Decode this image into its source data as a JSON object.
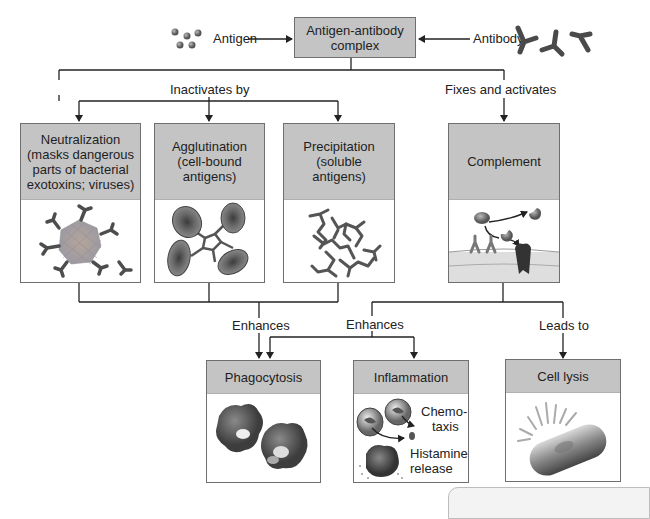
{
  "diagram": {
    "type": "flowchart",
    "title_node": {
      "label_line1": "Antigen-antibody",
      "label_line2": "complex"
    },
    "inputs": {
      "left": {
        "label": "Antigen",
        "icon": "antigen-particles-icon"
      },
      "right": {
        "label": "Antibody",
        "icon": "antibody-y-icon"
      }
    },
    "branches": {
      "left_label": "Inactivates by",
      "right_label": "Fixes and activates"
    },
    "mechanisms": [
      {
        "id": "neutralization",
        "lines": [
          "Neutralization",
          "(masks dangerous",
          "parts of bacterial",
          "exotoxins; viruses)"
        ],
        "icon": "virus-with-antibodies-icon"
      },
      {
        "id": "agglutination",
        "lines": [
          "Agglutination",
          "(cell-bound",
          "antigens)"
        ],
        "icon": "agglutinated-cells-icon"
      },
      {
        "id": "precipitation",
        "lines": [
          "Precipitation",
          "(soluble",
          "antigens)"
        ],
        "icon": "antibody-lattice-icon"
      },
      {
        "id": "complement",
        "lines": [
          "Complement"
        ],
        "icon": "complement-membrane-icon"
      }
    ],
    "edge_labels": {
      "enhances_left": "Enhances",
      "enhances_right": "Enhances",
      "leads_to": "Leads to"
    },
    "outcomes": [
      {
        "id": "phagocytosis",
        "label": "Phagocytosis",
        "icon": "phagocytes-icon"
      },
      {
        "id": "inflammation",
        "label": "Inflammation",
        "icon": "inflammation-cells-icon",
        "annotations": {
          "chemotaxis_1": "Chemo-",
          "chemotaxis_2": "taxis",
          "histamine_1": "Histamine",
          "histamine_2": "release"
        }
      },
      {
        "id": "cell_lysis",
        "label": "Cell lysis",
        "icon": "lysing-bacterium-icon"
      }
    ],
    "colors": {
      "header_gray": "#c4c4c4",
      "line": "#222222",
      "border": "#6f6f6f",
      "antibody": "#4a4a4a",
      "cell_red": "#7a7a7a"
    }
  }
}
